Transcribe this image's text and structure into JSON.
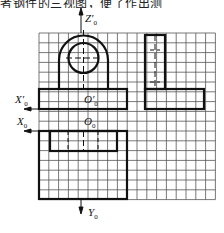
{
  "header": {
    "text": "者钢件的三视图，便了作出测"
  },
  "axes": {
    "z_top": "Z′",
    "z_sub": "0",
    "x_prime": "X′",
    "x_prime_sub": "0",
    "x": "X",
    "x_sub": "0",
    "y": "Y",
    "y_sub": "0",
    "o_prime": "O′",
    "o_prime_sub": "0",
    "o": "O",
    "o_sub": "0"
  },
  "grid": {
    "columns": 18,
    "rows": 17,
    "cell_px": 9.8,
    "origin": [
      39,
      33
    ],
    "line_color": "#555555"
  },
  "colors": {
    "outline": "#111111",
    "grid": "#555555",
    "background": "#ffffff"
  }
}
